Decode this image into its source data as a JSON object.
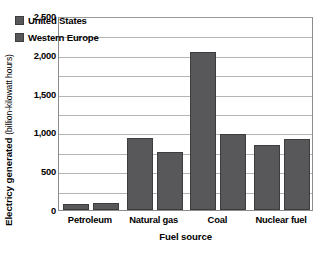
{
  "chart_data": {
    "type": "bar",
    "title": "",
    "subtitle": "",
    "xlabel": "Fuel source",
    "ylabel": "Electricy generated",
    "ylabel_unit": "(billion-kilowatt hours)",
    "categories": [
      "Petroleum",
      "Natural gas",
      "Coal",
      "Nuclear fuel"
    ],
    "series": [
      {
        "name": "United States",
        "values": [
          75,
          930,
          2030,
          840
        ]
      },
      {
        "name": "Western Europe",
        "values": [
          85,
          750,
          980,
          920
        ]
      }
    ],
    "ylim": [
      0,
      2500
    ],
    "yticks": [
      0,
      500,
      1000,
      1500,
      2000,
      2500
    ],
    "ytick_labels": [
      "0",
      "500",
      "1,000",
      "1,500",
      "2,000",
      "2,500"
    ],
    "gridlines": [
      250,
      500,
      750,
      1000,
      1250,
      1500,
      1750,
      2000,
      2250
    ],
    "grid": true,
    "legend_position": "top-left-inside",
    "colors": {
      "bar_fill": "#58585a",
      "bar_edge": "#3d3d3f",
      "gridline": "#b4b4b4",
      "frame": "#8c8c8c",
      "background": "#ffffff",
      "text": "#000000"
    }
  },
  "legend": {
    "items": [
      {
        "label": "United States"
      },
      {
        "label": "Western Europe"
      }
    ]
  }
}
